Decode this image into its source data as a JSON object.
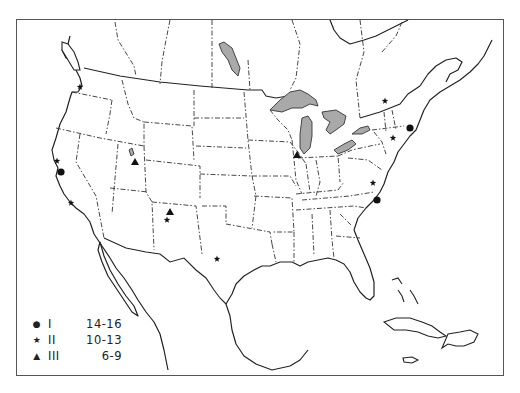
{
  "map": {
    "title": "",
    "region": "North America (contiguous US, southern Canada, Mexico, Caribbean)",
    "colors": {
      "water_body_fill": "#a9a9a9",
      "line": "#222222",
      "background": "#ffffff"
    }
  },
  "legend": {
    "items": [
      {
        "symbol": "circle",
        "glyph": "●",
        "class": "I",
        "range": "14-16"
      },
      {
        "symbol": "star",
        "glyph": "★",
        "class": "II",
        "range": "10-13"
      },
      {
        "symbol": "triangle",
        "glyph": "▲",
        "class": "III",
        "range": "6-9"
      }
    ]
  },
  "markers": [
    {
      "type": "star",
      "x": 57,
      "y": 161
    },
    {
      "type": "circle",
      "x": 61,
      "y": 172
    },
    {
      "type": "star",
      "x": 71,
      "y": 203
    },
    {
      "type": "star",
      "x": 80,
      "y": 87
    },
    {
      "type": "triangle",
      "x": 135,
      "y": 162
    },
    {
      "type": "triangle",
      "x": 170,
      "y": 212
    },
    {
      "type": "star",
      "x": 167,
      "y": 220
    },
    {
      "type": "star",
      "x": 217,
      "y": 259
    },
    {
      "type": "triangle",
      "x": 297,
      "y": 155
    },
    {
      "type": "star",
      "x": 385,
      "y": 101
    },
    {
      "type": "circle",
      "x": 410,
      "y": 128
    },
    {
      "type": "star",
      "x": 393,
      "y": 138
    },
    {
      "type": "star",
      "x": 373,
      "y": 183
    },
    {
      "type": "circle",
      "x": 377,
      "y": 200
    }
  ]
}
